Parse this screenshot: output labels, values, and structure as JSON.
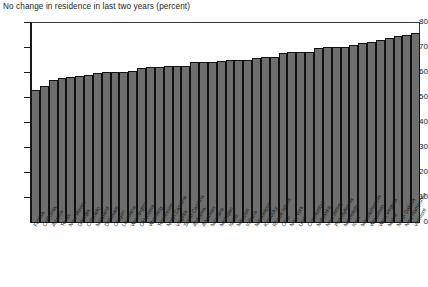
{
  "chart": {
    "title": "No change in residence in last two years (percent)",
    "y_ticks": [
      "80",
      "70",
      "60",
      "50",
      "40",
      "30",
      "20",
      "10",
      "0"
    ]
  },
  "chart_data": {
    "type": "bar",
    "title": "No change in residence in last two years (percent)",
    "xlabel": "",
    "ylabel": "",
    "ylim": [
      0,
      80
    ],
    "ytick_values": [
      0,
      10,
      20,
      30,
      40,
      50,
      60,
      70,
      80
    ],
    "grid": false,
    "legend": null,
    "bar_color": "#6e6e6e",
    "bar_edge_color": "#111111",
    "background": "#ffffff",
    "orientation": "vertical",
    "sorted": "ascending",
    "categories": [
      "Florida",
      "California",
      "Arizona",
      "Texas",
      "New Mexico",
      "Georgia",
      "Colorado",
      "Maryland",
      "Delaware",
      "Oregon",
      "Louisiana",
      "Washington",
      "Oklahoma",
      "Wyoming",
      "Tennessee",
      "North Carolina",
      "Virginia",
      "South Carolina",
      "Alabama",
      "Arkansas",
      "Montana",
      "Michigan",
      "Idaho",
      "Missouri",
      "Indiana",
      "Mississippi",
      "Kentucky",
      "Rhode Island",
      "Ohio",
      "New York",
      "Utah",
      "Connecticut",
      "Nebraska",
      "New Jersey",
      "Pennsylvania",
      "Minnesota",
      "Iowa",
      "Massachusetts",
      "Wisconsin",
      "West Virginia",
      "Maine",
      "North Dakota",
      "New Hampshire",
      "Vermont"
    ],
    "values": [
      53,
      54.5,
      57,
      57.5,
      58,
      58.5,
      59,
      59.5,
      60,
      60,
      60,
      60.5,
      61.5,
      62,
      62,
      62.5,
      62.5,
      62.5,
      64,
      64,
      64,
      64.5,
      65,
      65,
      65,
      65.5,
      66,
      66,
      67.5,
      68,
      68,
      68,
      69.5,
      70,
      70,
      70,
      71,
      71.5,
      72,
      73,
      73.5,
      74.5,
      75,
      75.5
    ]
  }
}
